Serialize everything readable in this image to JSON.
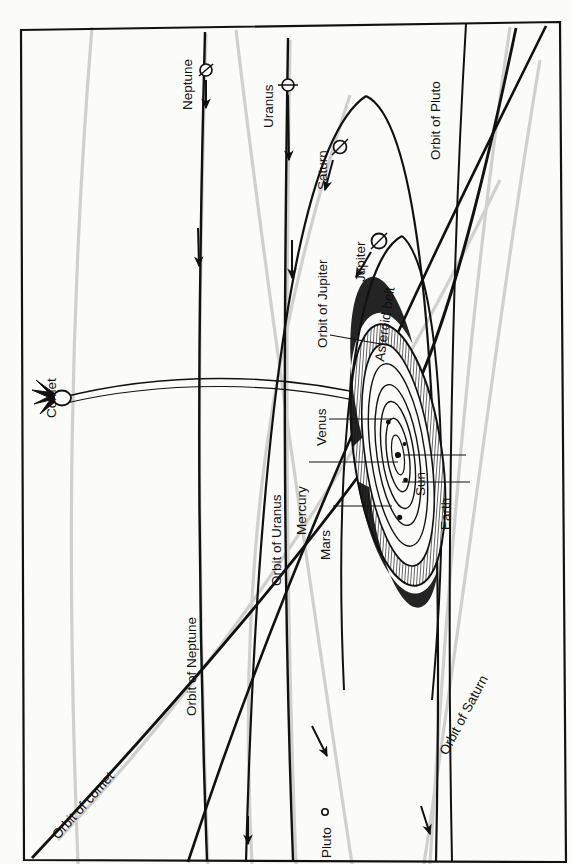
{
  "figure": {
    "type": "diagram",
    "caption_strip": "",
    "orientation": "rotated-90-counterclockwise",
    "frame": {
      "border_color": "#111111",
      "background": "#fbfbf9"
    }
  },
  "labels": {
    "comet": "Comet",
    "neptune": "Neptune",
    "uranus": "Uranus",
    "saturn": "Saturn",
    "jupiter": "Jupiter",
    "pluto": "Pluto",
    "mercury": "Mercury",
    "venus": "Venus",
    "mars": "Mars",
    "earth": "Earth",
    "sun": "Sun",
    "asteroid_belt": "Asteroid belt",
    "orbit_of_pluto": "Orbit of Pluto",
    "orbit_of_neptune": "Orbit of Neptune",
    "orbit_of_uranus": "Orbit of Uranus",
    "orbit_of_saturn": "Orbit of Saturn",
    "orbit_of_jupiter": "Orbit of Jupiter",
    "orbit_of_comet": "Orbit of comet"
  },
  "bodies": [
    {
      "name": "Comet",
      "symbol": "comet-with-tail"
    },
    {
      "name": "Neptune",
      "symbol": "circle-with-axis"
    },
    {
      "name": "Uranus",
      "symbol": "circle-with-axis"
    },
    {
      "name": "Saturn",
      "symbol": "circle-with-axis"
    },
    {
      "name": "Jupiter",
      "symbol": "circle-with-axis"
    },
    {
      "name": "Pluto",
      "symbol": "small-open-circle"
    },
    {
      "name": "Sun",
      "symbol": "center-dot"
    },
    {
      "name": "Mercury",
      "symbol": "dot"
    },
    {
      "name": "Venus",
      "symbol": "dot"
    },
    {
      "name": "Earth",
      "symbol": "dot"
    },
    {
      "name": "Mars",
      "symbol": "dot"
    }
  ],
  "orbits": [
    {
      "name": "Orbit of Pluto"
    },
    {
      "name": "Orbit of Neptune"
    },
    {
      "name": "Orbit of Uranus"
    },
    {
      "name": "Orbit of Saturn"
    },
    {
      "name": "Orbit of Jupiter"
    },
    {
      "name": "Orbit of comet"
    }
  ],
  "colors": {
    "ink": "#111111",
    "scan_shadow": "#c9c9c6",
    "paper": "#fbfbf9",
    "belt_fill": "#7d7d7d"
  }
}
